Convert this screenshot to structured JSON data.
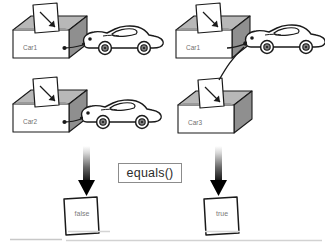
{
  "diagram": {
    "operator_label": "equals()",
    "colors": {
      "stroke": "#1a1a1a",
      "box_front": "#ffffff",
      "box_side": "#8c8c8c",
      "box_top": "#b8b8b8",
      "card_fill": "#ffffff",
      "text_gray": "#6f6f6f",
      "arrow_dark": "#000000",
      "divider": "#cfcfcf"
    },
    "left_group": {
      "result": "false",
      "boxes": [
        {
          "label": "Car1",
          "row": "top"
        },
        {
          "label": "Car2",
          "row": "bottom"
        }
      ],
      "cars": [
        {
          "name": "car-object-a",
          "row": "top"
        },
        {
          "name": "car-object-b",
          "row": "bottom"
        }
      ],
      "note": "each reference points to a distinct car object"
    },
    "right_group": {
      "result": "true",
      "boxes": [
        {
          "label": "Car1",
          "row": "top"
        },
        {
          "label": "Car3",
          "row": "bottom"
        }
      ],
      "cars": [
        {
          "name": "car-object-shared",
          "row": "top"
        }
      ],
      "note": "both references point to the same car object"
    },
    "arrows": [
      {
        "name": "result-arrow-left",
        "direction": "down",
        "target": "false"
      },
      {
        "name": "result-arrow-right",
        "direction": "down",
        "target": "true"
      }
    ],
    "dividers": 3
  }
}
